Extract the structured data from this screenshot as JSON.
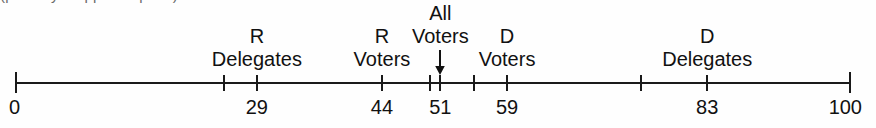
{
  "figure": {
    "type": "number-line",
    "caption_fragment": "(partially cropped caption)",
    "axis": {
      "min": 0,
      "max": 100,
      "min_label": "0",
      "max_label": "100"
    },
    "colors": {
      "line": "#1a1a1a",
      "text": "#111111",
      "background": "#fefefe"
    }
  },
  "chart_data": {
    "type": "number-line",
    "title": "",
    "xlabel": "",
    "ylabel": "",
    "xlim": [
      0,
      100
    ],
    "grid": false,
    "legend": "none",
    "axis_end_labels": [
      "0",
      "100"
    ],
    "points": [
      {
        "id": "r-delegates",
        "value": 29,
        "value_label": "29",
        "label_line1": "R",
        "label_line2": "Delegates",
        "has_arrow": false
      },
      {
        "id": "r-voters",
        "value": 44,
        "value_label": "44",
        "label_line1": "R",
        "label_line2": "Voters",
        "has_arrow": false
      },
      {
        "id": "all-voters",
        "value": 51,
        "value_label": "51",
        "label_line1": "All",
        "label_line2": "Voters",
        "has_arrow": true
      },
      {
        "id": "d-voters",
        "value": 59,
        "value_label": "59",
        "label_line1": "D",
        "label_line2": "Voters",
        "has_arrow": false
      },
      {
        "id": "d-delegates",
        "value": 83,
        "value_label": "83",
        "label_line1": "D",
        "label_line2": "Delegates",
        "has_arrow": false
      }
    ],
    "unlabeled_ticks": [
      25,
      55,
      75
    ]
  }
}
